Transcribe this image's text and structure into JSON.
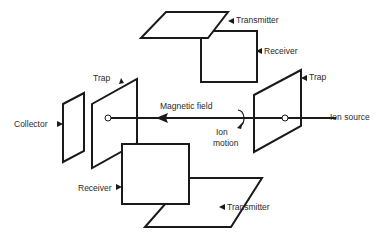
{
  "diagram": {
    "labels": {
      "transmitter_top": "Transmitter",
      "receiver_top": "Receiver",
      "trap_left": "Trap",
      "trap_right": "Trap",
      "collector": "Collector",
      "magnetic_field": "Magnetic field",
      "ion_motion_line1": "Ion",
      "ion_motion_line2": "motion",
      "ion_source": "Ion source",
      "receiver_bottom": "Receiver",
      "transmitter_bottom": "Transmitter"
    },
    "colors": {
      "line": "#1a1a1a",
      "text": "#2a2a2a",
      "background": "#ffffff"
    }
  }
}
